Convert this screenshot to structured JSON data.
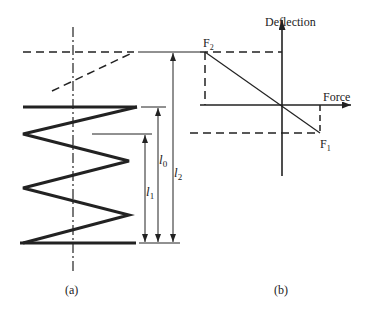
{
  "figure": {
    "panel_a": {
      "caption": "(a)",
      "labels": {
        "l0": "l",
        "l0_sub": "0",
        "l1": "l",
        "l1_sub": "1",
        "l2": "l",
        "l2_sub": "2"
      }
    },
    "panel_b": {
      "caption": "(b)",
      "y_axis_label": "Deflection",
      "x_axis_label": "Force",
      "point_f2": {
        "label": "F",
        "sub": "2"
      },
      "point_f1": {
        "label": "F",
        "sub": "1"
      }
    },
    "colors": {
      "line": "#222222",
      "background": "#ffffff"
    }
  }
}
